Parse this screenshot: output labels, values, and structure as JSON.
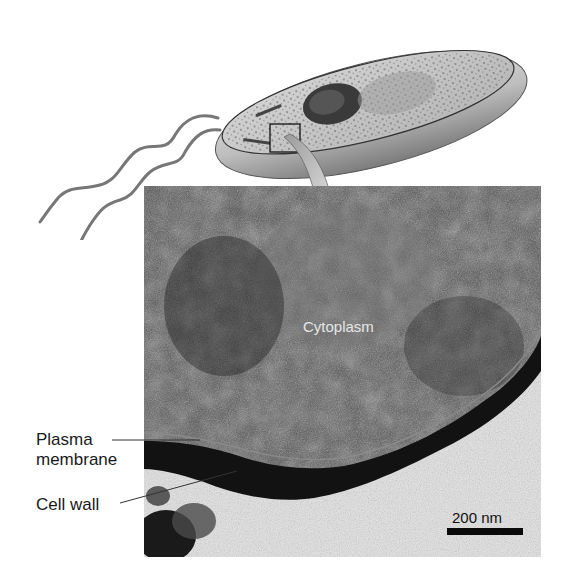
{
  "figure": {
    "illustration": {
      "subject": "rod-shaped bacterium with flagella",
      "flagella_count": 2,
      "inset_box": "enlarged region marker",
      "arrow": "zoom arrow pointing to micrograph"
    },
    "micrograph": {
      "labels": {
        "cytoplasm": "Cytoplasm",
        "plasma_membrane": [
          "Plasma",
          "membrane"
        ],
        "cell_wall": "Cell wall"
      },
      "scale_bar": {
        "text": "200 nm"
      }
    }
  },
  "colors": {
    "micrograph_dark": "#2a2a2a",
    "micrograph_mid": "#5a5a5a",
    "background_light": "#e4e4e4",
    "cell_body": "#b9b9b9",
    "cell_wall_dark": "#121212",
    "arrow": "#c9c9c9"
  }
}
